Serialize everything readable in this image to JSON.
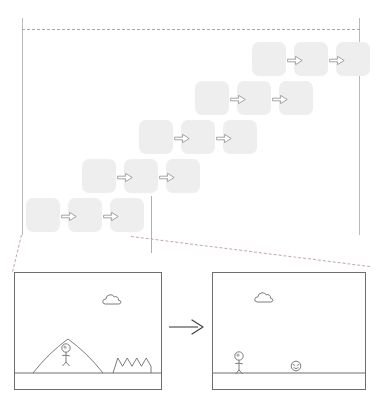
{
  "figure": {
    "background_color": "#ffffff",
    "line_color": "#6e6e6e",
    "cell_color": "#eeeeee",
    "dashed_callout_color": "#c3a9a9"
  },
  "timeline": {
    "name": "diagonal-frame-staircase",
    "panel": {
      "x": 22,
      "y": 18,
      "width": 338,
      "height": 217
    },
    "cell": {
      "width": 34,
      "height": 34,
      "radius": 7,
      "fill": "#eeeeee"
    },
    "arrow_icon": "block-arrow-right-icon",
    "rows": [
      {
        "index": 0,
        "label": "row-1",
        "y": 24,
        "cells": [
          {
            "label": "frame-1-1",
            "x": 230
          },
          {
            "label": "frame-1-2",
            "x": 272
          },
          {
            "label": "frame-1-3",
            "x": 314
          }
        ],
        "arrows": [
          {
            "label": "arrow-1-1",
            "x": 265,
            "y": 37
          },
          {
            "label": "arrow-1-2",
            "x": 307,
            "y": 37
          }
        ]
      },
      {
        "index": 1,
        "label": "row-2",
        "y": 63,
        "cells": [
          {
            "label": "frame-2-1",
            "x": 173
          },
          {
            "label": "frame-2-2",
            "x": 215
          },
          {
            "label": "frame-2-3",
            "x": 257
          }
        ],
        "arrows": [
          {
            "label": "arrow-2-1",
            "x": 208,
            "y": 76
          },
          {
            "label": "arrow-2-2",
            "x": 250,
            "y": 76
          }
        ]
      },
      {
        "index": 2,
        "label": "row-3",
        "y": 102,
        "cells": [
          {
            "label": "frame-3-1",
            "x": 117
          },
          {
            "label": "frame-3-2",
            "x": 159
          },
          {
            "label": "frame-3-3",
            "x": 201
          }
        ],
        "arrows": [
          {
            "label": "arrow-3-1",
            "x": 152,
            "y": 115
          },
          {
            "label": "arrow-3-2",
            "x": 194,
            "y": 115
          }
        ]
      },
      {
        "index": 3,
        "label": "row-4",
        "y": 141,
        "cells": [
          {
            "label": "frame-4-1",
            "x": 60
          },
          {
            "label": "frame-4-2",
            "x": 102
          },
          {
            "label": "frame-4-3",
            "x": 144
          }
        ],
        "arrows": [
          {
            "label": "arrow-4-1",
            "x": 95,
            "y": 154
          },
          {
            "label": "arrow-4-2",
            "x": 137,
            "y": 154
          }
        ]
      },
      {
        "index": 4,
        "label": "row-5",
        "y": 180,
        "cells": [
          {
            "label": "frame-5-1",
            "x": 4
          },
          {
            "label": "frame-5-2",
            "x": 46
          },
          {
            "label": "frame-5-3",
            "x": 88
          }
        ],
        "arrows": [
          {
            "label": "arrow-5-1",
            "x": 39,
            "y": 193
          },
          {
            "label": "arrow-5-2",
            "x": 81,
            "y": 193
          }
        ]
      }
    ]
  },
  "callout": {
    "name": "zoom-callout",
    "description": "dashed lines connecting last row of timeline down to the detail scenes",
    "lines": [
      {
        "label": "callout-line-left",
        "x1": 22,
        "y1": 235,
        "x2": 13,
        "y2": 272
      },
      {
        "label": "callout-line-right",
        "x1": 131,
        "y1": 236,
        "x2": 370,
        "y2": 266
      }
    ]
  },
  "scenes": {
    "name": "before-after-detail",
    "transition_arrow_label": "transition-arrow-right",
    "panels": [
      {
        "label": "scene-before",
        "x": 14,
        "y": 272,
        "width": 148,
        "height": 118,
        "ground_y": 100,
        "elements": [
          {
            "type": "cloud",
            "label": "cloud-sprite",
            "x": 88,
            "y": 20
          },
          {
            "type": "hill",
            "label": "hill-shape",
            "x": 18,
            "y": 66,
            "width": 70,
            "height": 34
          },
          {
            "type": "stick-figure",
            "label": "player-character",
            "x": 47,
            "y": 70
          },
          {
            "type": "spiky-bush",
            "label": "spiky-terrain-shape",
            "x": 98,
            "y": 85,
            "width": 38,
            "height": 15
          }
        ]
      },
      {
        "label": "scene-after",
        "x": 212,
        "y": 272,
        "width": 154,
        "height": 118,
        "ground_y": 100,
        "elements": [
          {
            "type": "cloud",
            "label": "cloud-sprite",
            "x": 42,
            "y": 18
          },
          {
            "type": "stick-figure",
            "label": "player-character",
            "x": 22,
            "y": 78
          },
          {
            "type": "enemy-face",
            "label": "enemy-sprite",
            "x": 78,
            "y": 88
          }
        ]
      }
    ],
    "arrow": {
      "x": 168,
      "y": 318,
      "width": 40,
      "height": 18
    }
  }
}
